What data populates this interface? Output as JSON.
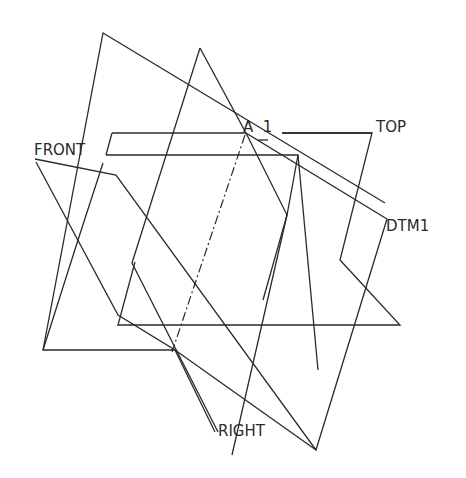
{
  "labels": {
    "front": "FRONT",
    "top": "TOP",
    "right": "RIGHT",
    "dtm1": "DTM1",
    "axis": "A_1"
  },
  "colors": {
    "line": "#2a2a2a",
    "background": "#ffffff"
  }
}
